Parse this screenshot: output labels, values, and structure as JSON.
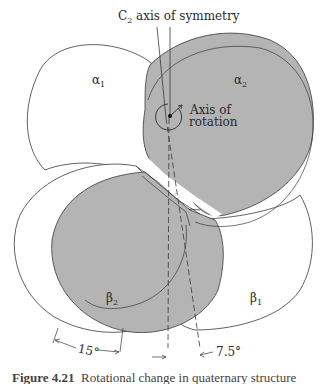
{
  "figure": {
    "title_label": "C",
    "title_sub": "2",
    "title_rest": " axis of symmetry",
    "axis_label_line1": "Axis of",
    "axis_label_line2": "rotation",
    "subunits": [
      {
        "id": "alpha1",
        "glyph": "α",
        "sub": "1",
        "shaded": false
      },
      {
        "id": "alpha2",
        "glyph": "α",
        "sub": "2",
        "shaded": true
      },
      {
        "id": "beta2",
        "glyph": "β",
        "sub": "2",
        "shaded": true
      },
      {
        "id": "beta1",
        "glyph": "β",
        "sub": "1",
        "shaded": false
      }
    ],
    "angles": {
      "left": "15°",
      "right": "7.5°"
    },
    "colors": {
      "shade": "#b4b4b4",
      "line": "#3a3a3a",
      "background": "#ffffff"
    }
  },
  "caption": {
    "number": "Figure 4.21",
    "text": "Rotational change in quaternary structure"
  }
}
